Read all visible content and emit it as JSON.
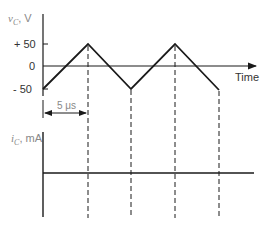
{
  "diagram": {
    "top_plot": {
      "y_label_symbol": "v",
      "y_label_sub": "C",
      "y_label_unit": ", V",
      "ticks": [
        "+ 50",
        "0",
        "- 50"
      ],
      "x_label": "Time",
      "period_label": "5 μs",
      "waveform": "triangle",
      "points": [
        [
          0,
          -50
        ],
        [
          5,
          50
        ],
        [
          10,
          -50
        ],
        [
          15,
          50
        ],
        [
          20,
          -50
        ]
      ]
    },
    "bottom_plot": {
      "y_label_symbol": "i",
      "y_label_sub": "C",
      "y_label_unit": ", mA",
      "waveform": "constant",
      "value": 0
    },
    "markers_us": [
      5,
      10,
      15,
      20
    ],
    "colors": {
      "line": "#1a1a1a",
      "label": "#888888"
    }
  }
}
